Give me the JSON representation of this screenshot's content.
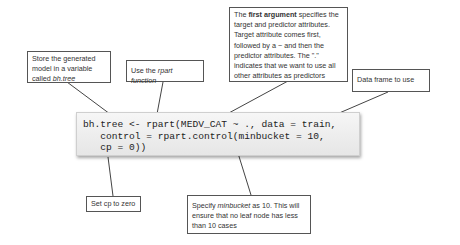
{
  "code": {
    "lines": [
      "bh.tree <- rpart(MEDV_CAT ~ ., data = train,",
      "   control = rpart.control(minbucket = 10,",
      "   cp = 0))"
    ]
  },
  "callouts": {
    "store_model": {
      "prefix": "Store the generated model in a variable called ",
      "emphasis": "bh.tree"
    },
    "use_rpart": {
      "prefix": "Use the ",
      "emphasis": "rpart function"
    },
    "first_argument": {
      "prefix": "The ",
      "bold": "first argument",
      "rest": " specifies the target and predictor attributes. Target attribute comes first, followed by a ~ and then the predictor attributes. The \".\" indicates that we want to use all other attributes as predictors"
    },
    "data_frame": {
      "text": "Data frame to use"
    },
    "set_cp": {
      "text": "Set cp to zero"
    },
    "minbucket": {
      "prefix": "Specify ",
      "emphasis": "minbucket",
      "rest": " as 10. This will ensure that no leaf node has less than 10 cases"
    }
  }
}
